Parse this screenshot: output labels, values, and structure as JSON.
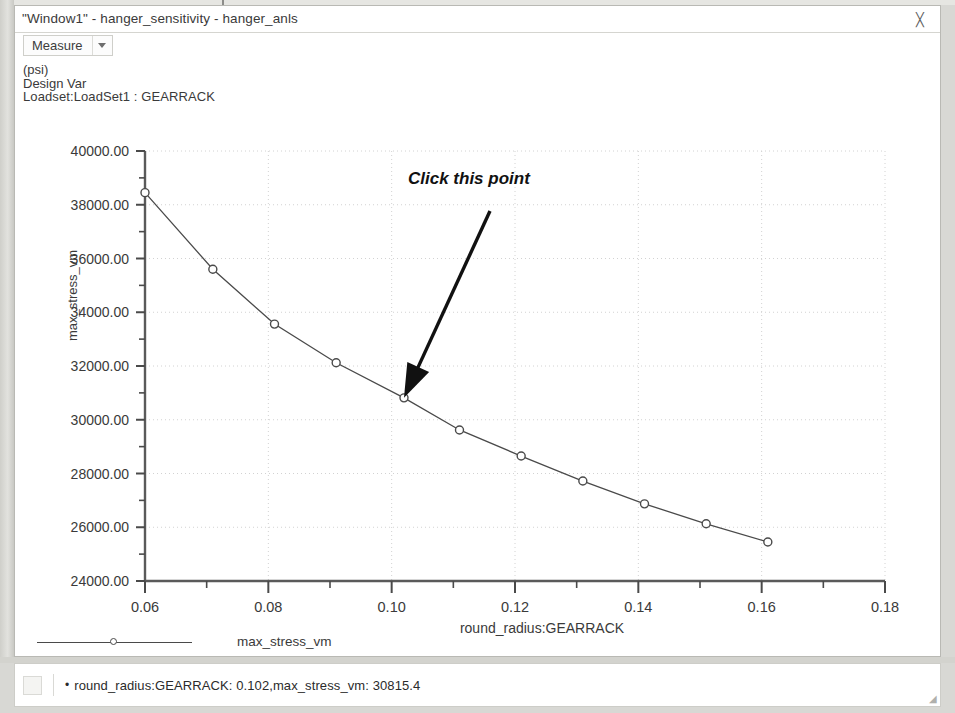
{
  "window": {
    "title": "\"Window1\" - hanger_sensitivity - hanger_anls",
    "close_glyph": "╳"
  },
  "toolbar": {
    "measure_label": "Measure"
  },
  "header": {
    "units": "(psi)",
    "kind": "Design Var",
    "loadset": "Loadset:LoadSet1 :  GEARRACK"
  },
  "annotation": {
    "text": "Click this point"
  },
  "legend": {
    "series_label": "max_stress_vm"
  },
  "status": {
    "bullet": "•",
    "text": "round_radius:GEARRACK: 0.102,max_stress_vm: 30815.4"
  },
  "chart_data": {
    "type": "line",
    "title": "",
    "xlabel": "round_radius:GEARRACK",
    "ylabel": "max_stress_vm",
    "units": "(psi)",
    "xlim": [
      0.06,
      0.18
    ],
    "ylim": [
      24000,
      40000
    ],
    "xticks": [
      0.06,
      0.08,
      0.1,
      0.12,
      0.14,
      0.16,
      0.18
    ],
    "xticklabels": [
      "0.06",
      "0.08",
      "0.10",
      "0.12",
      "0.14",
      "0.16",
      "0.18"
    ],
    "yticks": [
      24000,
      26000,
      28000,
      30000,
      32000,
      34000,
      36000,
      38000,
      40000
    ],
    "yticklabels": [
      "24000.00",
      "26000.00",
      "28000.00",
      "30000.00",
      "32000.00",
      "34000.00",
      "36000.00",
      "38000.00",
      "40000.00"
    ],
    "x_minor_step": 0.01,
    "y_minor_step": 1000,
    "grid": true,
    "legend_position": "below",
    "marker": "circle-open",
    "series": [
      {
        "name": "max_stress_vm",
        "x": [
          0.06,
          0.071,
          0.081,
          0.091,
          0.102,
          0.111,
          0.121,
          0.131,
          0.141,
          0.151,
          0.161
        ],
        "values": [
          38450,
          35600,
          33560,
          32120,
          30815.4,
          29620,
          28650,
          27720,
          26870,
          26130,
          25450
        ]
      }
    ],
    "highlighted_point": {
      "x": 0.102,
      "y": 30815.4,
      "label": "round_radius:GEARRACK: 0.102,max_stress_vm: 30815.4"
    }
  }
}
